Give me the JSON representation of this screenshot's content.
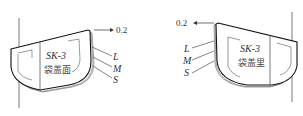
{
  "diagram": {
    "left_panel": {
      "code": "SK-3",
      "name": "袋盖面",
      "offset_label": "0.2",
      "size_labels": [
        "L",
        "M",
        "S"
      ]
    },
    "right_panel": {
      "code": "SK-3",
      "name": "袋盖里",
      "offset_label": "0.2",
      "size_labels": [
        "L",
        "M",
        "S"
      ]
    },
    "colors": {
      "line": "#333333",
      "outline": "#111111",
      "background": "#ffffff"
    }
  }
}
